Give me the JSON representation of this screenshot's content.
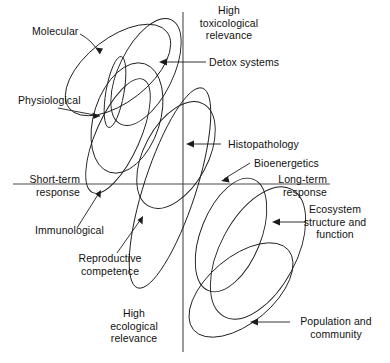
{
  "figure": {
    "type": "conceptual-scatter-diagram",
    "axes": {
      "vertical_top_label": "High\ntoxicological\nrelevance",
      "vertical_bottom_label": "High\necological\nrelevance",
      "horizontal_left_label": "Short-term\nresponse",
      "horizontal_right_label": "Long-term\nresponse",
      "vertical_line": {
        "x": 183,
        "y1": 12,
        "y2": 352
      },
      "horizontal_line": {
        "y": 184,
        "x1": 13,
        "x2": 330
      },
      "line_color": "#4a4a4a"
    },
    "stroke_color": "#1b1b1b",
    "background": "#ffffff",
    "labels": [
      {
        "name": "molecular",
        "text": "Molecular"
      },
      {
        "name": "physiological",
        "text": "Physiological"
      },
      {
        "name": "detox-systems",
        "text": "Detox systems"
      },
      {
        "name": "histopathology",
        "text": "Histopathology"
      },
      {
        "name": "bioenergetics",
        "text": "Bioenergetics"
      },
      {
        "name": "ecosystem-structure-and-function",
        "text": "Ecosystem\nstructure and\nfunction"
      },
      {
        "name": "immunological",
        "text": "Immunological"
      },
      {
        "name": "reproductive-competence",
        "text": "Reproductive\ncompetence"
      },
      {
        "name": "population-and-community",
        "text": "Population and\ncommunity"
      },
      {
        "name": "high-toxicological-relevance",
        "text": "High\ntoxicological\nrelevance"
      },
      {
        "name": "high-ecological-relevance",
        "text": "High\necological\nrelevance"
      },
      {
        "name": "short-term-response",
        "text": "Short-term\nresponse"
      },
      {
        "name": "long-term-response",
        "text": "Long-term\nresponse"
      }
    ],
    "ellipses": [
      {
        "name": "molecular-ellipse",
        "cx": 118,
        "cy": 70,
        "rx": 62,
        "ry": 32,
        "rot": -38
      },
      {
        "name": "detox-ellipse",
        "cx": 146,
        "cy": 72,
        "rx": 58,
        "ry": 27,
        "rot": -64
      },
      {
        "name": "physiological-ellipse",
        "cx": 127,
        "cy": 118,
        "rx": 57,
        "ry": 33,
        "rot": -72
      },
      {
        "name": "immunological-ellipse",
        "cx": 118,
        "cy": 136,
        "rx": 62,
        "ry": 22,
        "rot": -66
      },
      {
        "name": "small-inner-ellipse",
        "cx": 115,
        "cy": 92,
        "rx": 36,
        "ry": 9,
        "rot": -80
      },
      {
        "name": "histopathology-ellipse",
        "cx": 176,
        "cy": 155,
        "rx": 58,
        "ry": 32,
        "rot": -62
      },
      {
        "name": "reproductive-ellipse",
        "cx": 170,
        "cy": 188,
        "rx": 105,
        "ry": 26,
        "rot": -72
      },
      {
        "name": "bioenergetics-ellipse",
        "cx": 231,
        "cy": 235,
        "rx": 60,
        "ry": 30,
        "rot": -68
      },
      {
        "name": "ecosystem-ellipse",
        "cx": 258,
        "cy": 253,
        "rx": 72,
        "ry": 38,
        "rot": -62
      },
      {
        "name": "population-ellipse",
        "cx": 241,
        "cy": 290,
        "rx": 62,
        "ry": 33,
        "rot": -40
      }
    ]
  }
}
